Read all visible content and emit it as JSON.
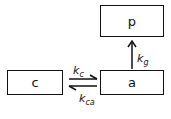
{
  "diagram": {
    "compartments": [
      {
        "id": "p",
        "label": "p"
      },
      {
        "id": "c",
        "label": "c"
      },
      {
        "id": "a",
        "label": "a"
      }
    ],
    "rates": {
      "k_g": {
        "main": "k",
        "sub": "g",
        "from": "a",
        "to": "p"
      },
      "k_c": {
        "main": "k",
        "sub": "c",
        "from": "c",
        "to": "a"
      },
      "k_ca": {
        "main": "k",
        "sub": "ca",
        "from": "a",
        "to": "c"
      }
    }
  }
}
